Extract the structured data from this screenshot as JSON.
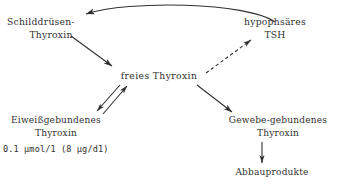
{
  "diagram": {
    "ink_color": "#303030",
    "background": "#ffffff",
    "nodes": {
      "thyroid_thyroxine": {
        "line_1": "Schilddrüsen-",
        "line_2": "Thyroxin"
      },
      "pituitary_tsh": {
        "line_1": "hypophsäres",
        "line_2": "TSH"
      },
      "free_thyroxine": {
        "line_1": "freies Thyroxin"
      },
      "protein_bound_thyroxine": {
        "line_1": "Eiweißgebundenes",
        "line_2": "Thyroxin",
        "concentration": "0.1 µmol/1  (8 µg/d1)"
      },
      "tissue_bound_thyroxine": {
        "line_1": "Gewebe-gebundenes",
        "line_2": "Thyroxin"
      },
      "degradation_products": {
        "line_1": "Abbauprodukte"
      }
    },
    "edges": [
      {
        "name": "tsh-to-thyroid",
        "from": "pituitary_tsh",
        "to": "thyroid_thyroxine",
        "style": "solid-curved",
        "direction": "right-to-left"
      },
      {
        "name": "thyroid-to-free",
        "from": "thyroid_thyroxine",
        "to": "free_thyroxine",
        "style": "solid",
        "direction": "down-right"
      },
      {
        "name": "free-to-tsh",
        "from": "free_thyroxine",
        "to": "pituitary_tsh",
        "style": "dashed",
        "direction": "up-right"
      },
      {
        "name": "free-to-protein-bound",
        "from": "free_thyroxine",
        "to": "protein_bound_thyroxine",
        "style": "solid",
        "direction": "down-left"
      },
      {
        "name": "protein-bound-to-free",
        "from": "protein_bound_thyroxine",
        "to": "free_thyroxine",
        "style": "solid",
        "direction": "up-right"
      },
      {
        "name": "free-to-tissue-bound",
        "from": "free_thyroxine",
        "to": "tissue_bound_thyroxine",
        "style": "solid",
        "direction": "down-right"
      },
      {
        "name": "tissue-bound-to-degradation",
        "from": "tissue_bound_thyroxine",
        "to": "degradation_products",
        "style": "solid",
        "direction": "down"
      }
    ]
  }
}
